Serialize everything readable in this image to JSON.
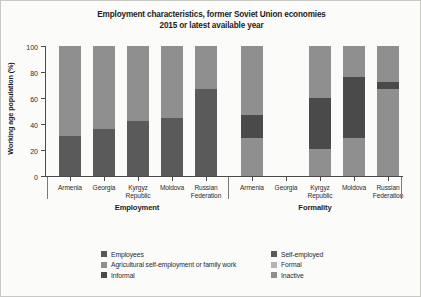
{
  "chart_data": {
    "type": "bar",
    "subtype": "stacked-bar-grouped",
    "title": "Employment characteristics, former Soviet Union economies",
    "subtitle": "2015 or latest available year",
    "title_lines": [
      "Employment characteristics, former Soviet Union economies",
      "2015 or latest available year"
    ],
    "xlabel": "",
    "ylabel": "Working age population (%)",
    "ylim": [
      0,
      100
    ],
    "yticks": [
      0,
      20,
      40,
      60,
      80,
      100
    ],
    "ytick_labels": [
      "0",
      "20",
      "40",
      "60",
      "80",
      "100"
    ],
    "grid": false,
    "legend_position": "bottom",
    "categories": [
      "Armenia",
      "Georgia",
      "Kyrgyz Republic",
      "Moldova",
      "Russian Federation"
    ],
    "category_label_lines": [
      [
        "Armenia"
      ],
      [
        "Georgia"
      ],
      [
        "Kyrgyz",
        "Republic"
      ],
      [
        "Moldova"
      ],
      [
        "Russian",
        "Federation"
      ]
    ],
    "groups": [
      {
        "name": "Employment",
        "categories": [
          "Armenia",
          "Georgia",
          "Kyrgyz Republic",
          "Moldova",
          "Russian Federation"
        ],
        "series": [
          {
            "name": "Employees",
            "color": "#5a5a5a",
            "values": [
              31,
              36,
              42,
              45,
              67
            ]
          },
          {
            "name": "Agricultural self-employment or family work",
            "color": "#8f8f8f",
            "values": [
              69,
              64,
              58,
              55,
              33
            ]
          }
        ]
      },
      {
        "name": "Formality",
        "categories": [
          "Armenia",
          "Georgia",
          "Kyrgyz Republic",
          "Moldova",
          "Russian Federation"
        ],
        "series": [
          {
            "name": "Inactive",
            "color": "#8f8f8f",
            "values": [
              29,
              null,
              21,
              29,
              67
            ]
          },
          {
            "name": "Informal",
            "color": "#4a4a4a",
            "values": [
              18,
              null,
              39,
              47,
              5
            ]
          },
          {
            "name": "Formal",
            "color": "#8f8f8f",
            "values": [
              53,
              null,
              40,
              24,
              28
            ]
          }
        ]
      }
    ],
    "missing_data_note": "Georgia has no data in the Formality group",
    "legend": [
      {
        "label": "Employees",
        "color": "#5a5a5a"
      },
      {
        "label": "Self-employed",
        "color": "#5a5a5a"
      },
      {
        "label": "Agricultural self-employment or family work",
        "color": "#8f8f8f"
      },
      {
        "label": "Formal",
        "color": "#b4b4b4"
      },
      {
        "label": "Informal",
        "color": "#4a4a4a"
      },
      {
        "label": "Inactive",
        "color": "#8f8f8f"
      }
    ],
    "colors": {
      "employees": "#5a5a5a",
      "self_employed": "#5a5a5a",
      "agricultural": "#8f8f8f",
      "formal": "#b4b4b4",
      "informal": "#4a4a4a",
      "inactive": "#8f8f8f",
      "axis": "#4a4a4a",
      "background": "#fbfbfa"
    }
  },
  "group_labels": [
    "Employment",
    "Formality"
  ]
}
